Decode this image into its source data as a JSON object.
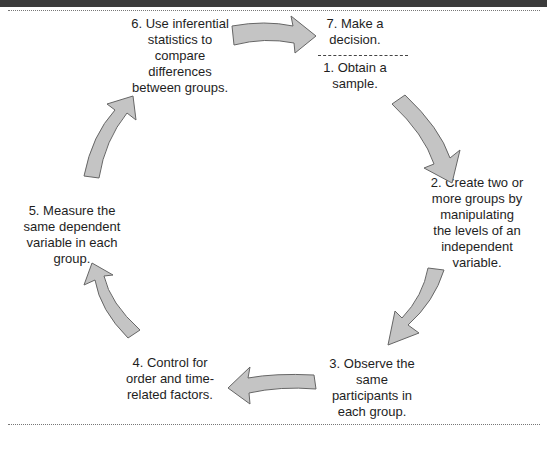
{
  "diagram": {
    "type": "cycle",
    "steps": [
      {
        "number": 1,
        "text": "1. Obtain a\nsample."
      },
      {
        "number": 2,
        "text": "2. Create two or\nmore groups by\nmanipulating\nthe levels of an\nindependent\nvariable."
      },
      {
        "number": 3,
        "text": "3. Observe the\nsame\nparticipants in\neach group."
      },
      {
        "number": 4,
        "text": "4. Control for\norder and time-\nrelated factors."
      },
      {
        "number": 5,
        "text": "5. Measure the\nsame dependent\nvariable in each\ngroup."
      },
      {
        "number": 6,
        "text": "6. Use inferential\nstatistics to\ncompare\ndifferences\nbetween groups."
      },
      {
        "number": 7,
        "text": "7. Make a\ndecision."
      }
    ],
    "flow": [
      "1→2",
      "2→3",
      "3→4",
      "4→5",
      "5→6",
      "6→7"
    ],
    "colors": {
      "header_bar": "#3b3b3b",
      "arrow_fill": "#c4c4c4",
      "arrow_stroke": "#666666"
    }
  }
}
